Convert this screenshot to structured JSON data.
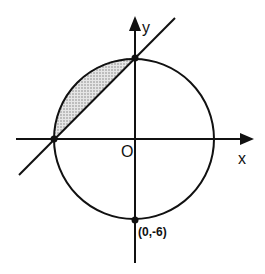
{
  "diagram": {
    "type": "coordinate-geometry",
    "axes": {
      "x_label": "x",
      "y_label": "y",
      "origin_label": "O"
    },
    "circle": {
      "center": [
        0,
        0
      ],
      "description": "circle centered at origin"
    },
    "points": [
      {
        "name": "top-intersection",
        "label": ""
      },
      {
        "name": "left-intersection",
        "label": ""
      },
      {
        "name": "bottom-point",
        "label": "(0,-6)"
      }
    ],
    "line": {
      "description": "line through left x-intercept and top y-intercept of circle"
    },
    "shaded_region": {
      "description": "circular segment between line and upper-left arc",
      "fill": "#bdbdbd"
    },
    "colors": {
      "stroke": "#111111",
      "background": "#ffffff",
      "shade": "#c8c8c8"
    }
  }
}
